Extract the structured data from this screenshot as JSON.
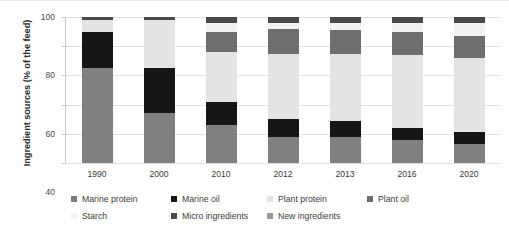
{
  "chart_data": {
    "type": "bar",
    "subtype": "stacked-bar-100",
    "title": "",
    "xlabel": "",
    "ylabel": "Ingredient sources (% of the feed)",
    "ylim": [
      0,
      100
    ],
    "yticks": [
      0,
      20,
      40,
      60,
      80,
      100
    ],
    "grid": true,
    "legend_position": "bottom",
    "categories": [
      "1990",
      "2000",
      "2010",
      "2012",
      "2013",
      "2016",
      "2020"
    ],
    "series": [
      {
        "name": "Marine protein",
        "color": "#808080",
        "values": [
          65,
          34,
          26,
          18,
          18,
          16,
          13
        ]
      },
      {
        "name": "Marine oil",
        "color": "#161616",
        "values": [
          25,
          31,
          16,
          12,
          11,
          8,
          8
        ]
      },
      {
        "name": "Plant protein",
        "color": "#e4e4e4",
        "values": [
          8,
          33,
          34,
          45,
          46,
          50,
          51
        ]
      },
      {
        "name": "Plant oil",
        "color": "#6e6e6e",
        "values": [
          0,
          0,
          14,
          17,
          16,
          16,
          15
        ]
      },
      {
        "name": "Starch",
        "color": "#f2f2f2",
        "values": [
          0,
          0,
          6,
          4,
          5,
          6,
          9
        ]
      },
      {
        "name": "Micro ingredients",
        "color": "#4a4a4a",
        "values": [
          2,
          2,
          4,
          4,
          4,
          4,
          4
        ]
      },
      {
        "name": "New ingredients",
        "color": "#9a9a9a",
        "values": [
          0,
          0,
          0,
          0,
          0,
          0,
          0
        ]
      }
    ]
  },
  "legend": {
    "items": [
      {
        "label": "Marine protein"
      },
      {
        "label": "Marine oil"
      },
      {
        "label": "Plant protein"
      },
      {
        "label": "Plant oil"
      },
      {
        "label": "Starch"
      },
      {
        "label": "Micro ingredients"
      },
      {
        "label": "New ingredients"
      }
    ]
  }
}
